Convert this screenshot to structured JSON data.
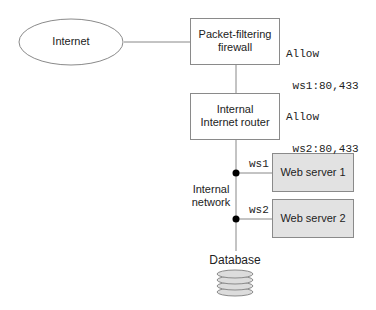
{
  "nodes": {
    "internet": {
      "label": "Internet"
    },
    "firewall": {
      "label_line1": "Packet-filtering",
      "label_line2": "firewall"
    },
    "router": {
      "label_line1": "Internal",
      "label_line2": "Internet router"
    },
    "web_server_1": {
      "label": "Web server 1",
      "interface": "ws1"
    },
    "web_server_2": {
      "label": "Web server 2",
      "interface": "ws2"
    },
    "database": {
      "label": "Database"
    },
    "internal_network": {
      "label_line1": "Internal",
      "label_line2": "network"
    }
  },
  "firewall_rules": [
    {
      "action": "Allow",
      "rule": " ws1:80,433"
    },
    {
      "action": "Allow",
      "rule": " ws2:80,433"
    }
  ],
  "colors": {
    "line": "#888888",
    "box_border": "#8a8a8a",
    "server_fill": "#e2e2e2",
    "disk_fill": "#dcdcdc",
    "dot": "#000000"
  }
}
